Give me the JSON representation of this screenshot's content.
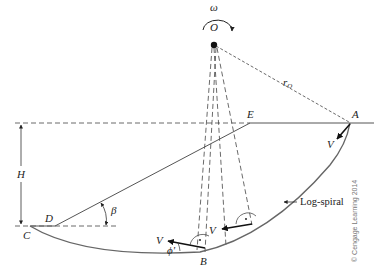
{
  "diagram": {
    "labels": {
      "omega": "ω",
      "O": "O",
      "rO": "r",
      "rO_sub": "O",
      "A": "A",
      "E": "E",
      "H": "H",
      "C": "C",
      "D": "D",
      "beta": "β",
      "B": "B",
      "V_top": "V",
      "V_mid": "V",
      "V_bottom": "V",
      "phi": "ϕ'",
      "log_spiral": "Log-spiral",
      "copyright": "© Cengage Learning 2014"
    },
    "colors": {
      "line": "#333333",
      "curve": "#555555",
      "text": "#222222"
    }
  }
}
